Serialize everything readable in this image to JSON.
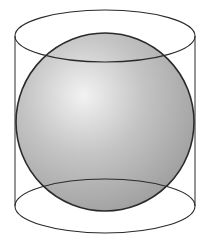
{
  "figure": {
    "title": "Sphere inscribed in a cylinder",
    "canvas": {
      "width": 210,
      "height": 243
    },
    "colors": {
      "background": "#ffffff",
      "stroke": "#2a2a2a",
      "sphere_highlight": "#f2f2f2",
      "sphere_mid": "#c4c4c4",
      "sphere_shadow": "#9a9a9a"
    },
    "cylinder": {
      "left_x": 15,
      "right_x": 195,
      "top_ellipse": {
        "cx": 105,
        "cy": 36,
        "rx": 90,
        "ry": 26
      },
      "bottom_ellipse": {
        "cx": 105,
        "cy": 206,
        "rx": 90,
        "ry": 27
      }
    },
    "sphere": {
      "cx": 105,
      "cy": 122,
      "r": 89
    }
  }
}
